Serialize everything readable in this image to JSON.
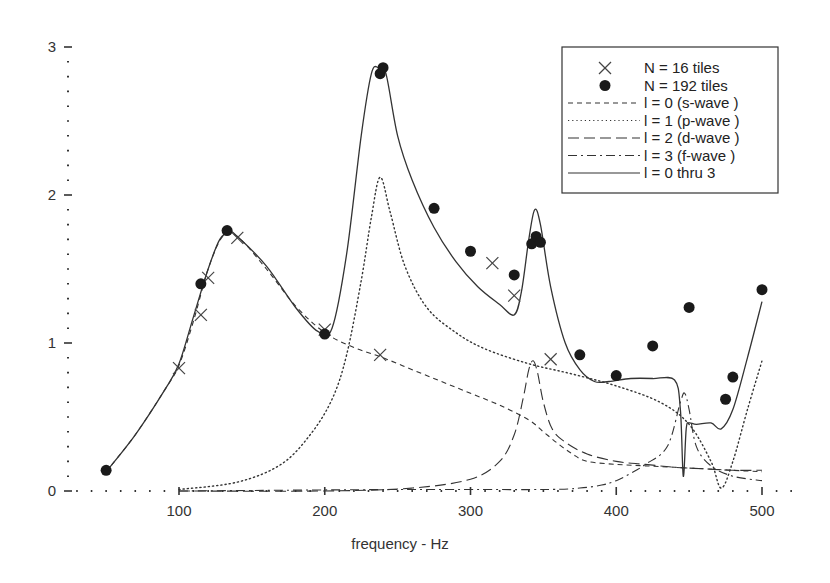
{
  "chart_data": {
    "type": "line",
    "title": "",
    "xlabel": "frequency - Hz",
    "ylabel": "",
    "xlim": [
      25,
      525
    ],
    "ylim": [
      0,
      3.05
    ],
    "grid": false,
    "legend_position": "upper right",
    "x_ticks": [
      100,
      200,
      300,
      400,
      500
    ],
    "x_tick_labels": [
      "100",
      "200",
      "300",
      "400",
      "500"
    ],
    "y_ticks": [
      0,
      1,
      2,
      3
    ],
    "y_tick_labels": [
      "0",
      "1",
      "2",
      "3"
    ],
    "legend": [
      {
        "marker": "cross",
        "label": "N =  16  tiles"
      },
      {
        "marker": "circle",
        "label": "N = 192 tiles"
      },
      {
        "style": "dashed",
        "label": "l = 0  (s-wave )"
      },
      {
        "style": "dotted",
        "label": "l = 1  (p-wave )"
      },
      {
        "style": "longdash",
        "label": "l = 2  (d-wave )"
      },
      {
        "style": "dashdot",
        "label": "l = 3  (f-wave )"
      },
      {
        "style": "solid",
        "label": "l = 0 thru 3"
      }
    ],
    "scatter_series": [
      {
        "name": "N = 16 tiles",
        "marker": "cross",
        "x": [
          100,
          115,
          120,
          140,
          200,
          238,
          315,
          330,
          355
        ],
        "y": [
          0.83,
          1.19,
          1.44,
          1.71,
          1.09,
          0.92,
          1.54,
          1.32,
          0.89
        ]
      },
      {
        "name": "N = 192 tiles",
        "marker": "circle",
        "x": [
          50,
          115,
          133,
          200,
          238,
          240,
          275,
          300,
          330,
          342,
          345,
          348,
          375,
          400,
          425,
          450,
          475,
          480,
          500
        ],
        "y": [
          0.14,
          1.4,
          1.76,
          1.06,
          2.82,
          2.86,
          1.91,
          1.62,
          1.46,
          1.67,
          1.72,
          1.68,
          0.92,
          0.78,
          0.98,
          1.24,
          0.62,
          0.77,
          1.36
        ]
      }
    ],
    "series": [
      {
        "name": "l = 0 (s-wave)",
        "style": "dashed",
        "x": [
          50,
          70,
          90,
          100,
          110,
          120,
          130,
          140,
          160,
          180,
          200,
          220,
          240,
          260,
          280,
          300,
          320,
          340,
          350,
          360,
          370,
          380,
          400,
          420,
          440,
          460,
          480,
          500
        ],
        "y": [
          0.13,
          0.38,
          0.68,
          0.85,
          1.15,
          1.5,
          1.72,
          1.72,
          1.5,
          1.25,
          1.07,
          0.97,
          0.9,
          0.82,
          0.74,
          0.66,
          0.58,
          0.48,
          0.4,
          0.32,
          0.25,
          0.2,
          0.18,
          0.17,
          0.16,
          0.15,
          0.14,
          0.13
        ]
      },
      {
        "name": "l = 1 (p-wave)",
        "style": "dotted",
        "x": [
          100,
          140,
          170,
          190,
          205,
          215,
          225,
          232,
          238,
          245,
          255,
          270,
          290,
          310,
          340,
          370,
          400,
          430,
          450,
          465,
          472,
          480,
          490,
          500
        ],
        "y": [
          0.01,
          0.06,
          0.18,
          0.38,
          0.62,
          0.92,
          1.42,
          1.85,
          2.12,
          1.88,
          1.52,
          1.24,
          1.07,
          0.96,
          0.86,
          0.79,
          0.71,
          0.6,
          0.45,
          0.2,
          0.02,
          0.2,
          0.55,
          0.88
        ]
      },
      {
        "name": "l = 2 (d-wave)",
        "style": "longdash",
        "x": [
          100,
          200,
          260,
          300,
          320,
          330,
          336,
          340,
          343,
          346,
          350,
          356,
          365,
          380,
          400,
          420,
          440,
          460,
          480,
          500
        ],
        "y": [
          0.0,
          0.0,
          0.02,
          0.08,
          0.2,
          0.38,
          0.62,
          0.82,
          0.88,
          0.8,
          0.6,
          0.42,
          0.33,
          0.25,
          0.2,
          0.18,
          0.16,
          0.15,
          0.14,
          0.14
        ]
      },
      {
        "name": "l = 3 (f-wave)",
        "style": "dashdot",
        "x": [
          100,
          250,
          350,
          375,
          390,
          400,
          410,
          420,
          435,
          444,
          447,
          450,
          455,
          465,
          480,
          500
        ],
        "y": [
          0.0,
          0.01,
          0.01,
          0.02,
          0.04,
          0.07,
          0.12,
          0.18,
          0.3,
          0.6,
          0.66,
          0.55,
          0.3,
          0.17,
          0.1,
          0.07
        ]
      },
      {
        "name": "l = 0 thru 3",
        "style": "solid",
        "x": [
          50,
          70,
          90,
          100,
          110,
          120,
          128,
          135,
          140,
          160,
          180,
          195,
          205,
          215,
          225,
          232,
          237,
          242,
          250,
          260,
          275,
          290,
          305,
          320,
          330,
          335,
          340,
          344,
          348,
          355,
          365,
          375,
          385,
          395,
          410,
          425,
          440,
          444,
          446,
          448,
          450,
          455,
          465,
          472,
          480,
          490,
          500
        ],
        "y": [
          0.13,
          0.38,
          0.68,
          0.86,
          1.18,
          1.5,
          1.7,
          1.75,
          1.72,
          1.52,
          1.24,
          1.08,
          1.1,
          1.6,
          2.4,
          2.82,
          2.86,
          2.82,
          2.4,
          2.1,
          1.78,
          1.55,
          1.38,
          1.26,
          1.19,
          1.35,
          1.7,
          1.9,
          1.8,
          1.38,
          1.0,
          0.82,
          0.74,
          0.74,
          0.76,
          0.76,
          0.75,
          0.55,
          0.1,
          0.42,
          0.46,
          0.45,
          0.46,
          0.42,
          0.55,
          0.9,
          1.28
        ]
      }
    ]
  }
}
